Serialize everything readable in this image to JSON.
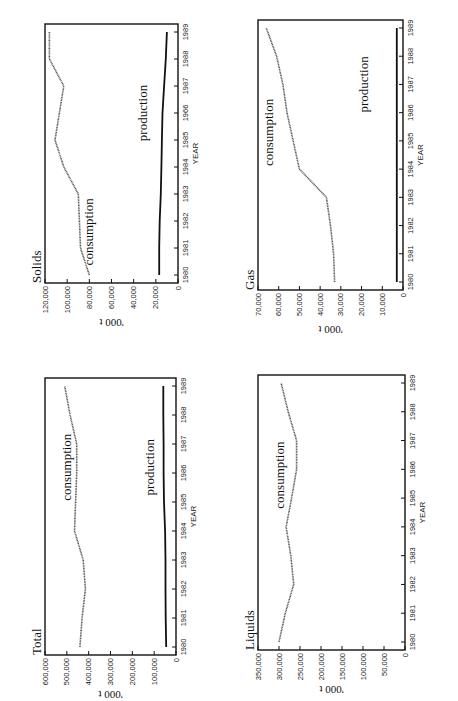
{
  "page": {
    "orientation": "rotated 90 degrees clockwise"
  },
  "chart_data": [
    {
      "id": "total",
      "type": "line",
      "title": "Total",
      "xlabel": "YEAR",
      "ylabel": "'000 t",
      "x": [
        1980,
        1981,
        1982,
        1983,
        1984,
        1985,
        1986,
        1987,
        1988,
        1989
      ],
      "x_tick_labels": [
        "1980",
        "1981",
        "1982",
        "1983",
        "1984",
        "1985",
        "1986",
        "1987",
        "1988",
        "1989"
      ],
      "y_tick_labels": [
        "0",
        "100,000",
        "200,000",
        "300,000",
        "400,000",
        "500,000",
        "600,000"
      ],
      "ylim": [
        0,
        600000
      ],
      "series": [
        {
          "name": "consumption",
          "values": [
            440000,
            430000,
            415000,
            425000,
            465000,
            460000,
            455000,
            455000,
            485000,
            510000
          ]
        },
        {
          "name": "production",
          "values": [
            45000,
            47000,
            48000,
            48000,
            50000,
            55000,
            57000,
            57000,
            58000,
            58000
          ]
        }
      ],
      "annotations": [
        "consumption",
        "production"
      ]
    },
    {
      "id": "solids",
      "type": "line",
      "title": "Solids",
      "xlabel": "YEAR",
      "ylabel": "'000 t",
      "x": [
        1980,
        1981,
        1982,
        1983,
        1984,
        1985,
        1986,
        1987,
        1988,
        1989
      ],
      "x_tick_labels": [
        "1980",
        "1981",
        "1982",
        "1983",
        "1984",
        "1985",
        "1966",
        "1987",
        "1988",
        "1989"
      ],
      "y_tick_labels": [
        "0",
        "20,000",
        "40,000",
        "60,000",
        "80,000",
        "100,000",
        "120,000"
      ],
      "ylim": [
        0,
        120000
      ],
      "series": [
        {
          "name": "consumption",
          "values": [
            80000,
            88000,
            89000,
            90000,
            103000,
            111000,
            107000,
            103000,
            116000,
            116000
          ]
        },
        {
          "name": "production",
          "values": [
            17000,
            17000,
            16500,
            15500,
            15000,
            14500,
            14000,
            12500,
            11000,
            10000
          ]
        }
      ],
      "annotations": [
        "consumption",
        "production"
      ]
    },
    {
      "id": "liquids",
      "type": "line",
      "title": "Liquids",
      "xlabel": "YEAR",
      "ylabel": "'000 t",
      "x": [
        1980,
        1981,
        1982,
        1983,
        1984,
        1985,
        1986,
        1987,
        1988,
        1989
      ],
      "x_tick_labels": [
        "1980",
        "1981",
        "1982",
        "1983",
        "1984",
        "1985",
        "1986",
        "1987",
        "1988",
        "1989"
      ],
      "y_tick_labels": [
        "0",
        "50,000",
        "100,000",
        "150,000",
        "200,000",
        "250,000",
        "300,000",
        "350,000"
      ],
      "ylim": [
        0,
        350000
      ],
      "series": [
        {
          "name": "consumption",
          "values": [
            300000,
            285000,
            265000,
            272000,
            283000,
            270000,
            258000,
            258000,
            278000,
            295000
          ]
        }
      ],
      "annotations": [
        "consumption"
      ]
    },
    {
      "id": "gas",
      "type": "line",
      "title": "Gas",
      "xlabel": "YEAR",
      "ylabel": "'000 t",
      "x": [
        1980,
        1981,
        1982,
        1983,
        1984,
        1985,
        1986,
        1987,
        1988,
        1989
      ],
      "x_tick_labels": [
        "1980",
        "1981",
        "1982",
        "1983",
        "1984",
        "1985",
        "1986",
        "1987",
        "1988",
        "1989"
      ],
      "y_tick_labels": [
        "0",
        "10,000",
        "20,000",
        "30,000",
        "40,000",
        "50,000",
        "60,000",
        "70,000"
      ],
      "ylim": [
        0,
        70000
      ],
      "series": [
        {
          "name": "consumption",
          "values": [
            33000,
            33500,
            35000,
            37000,
            50000,
            53000,
            56000,
            58000,
            61000,
            66000
          ]
        },
        {
          "name": "production",
          "values": [
            3000,
            3000,
            3000,
            3000,
            3000,
            3000,
            3000,
            3000,
            3000,
            3000
          ]
        }
      ],
      "annotations": [
        "consumption",
        "production"
      ]
    }
  ]
}
